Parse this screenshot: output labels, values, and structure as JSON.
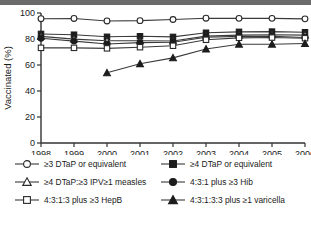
{
  "chart_data": {
    "type": "line",
    "title": "",
    "xlabel": "Year",
    "ylabel": "Vaccinated (%)",
    "x": [
      1998,
      1999,
      2000,
      2001,
      2002,
      2003,
      2004,
      2005,
      2006
    ],
    "xticklabels": [
      "1998",
      "1999",
      "2000",
      "2001",
      "2002",
      "2003",
      "2004",
      "2005",
      "2006"
    ],
    "yticklabels": [
      "0",
      "20",
      "40",
      "60",
      "80",
      "100"
    ],
    "yticks": [
      0,
      20,
      40,
      60,
      80,
      100
    ],
    "xlim": [
      1998,
      2006
    ],
    "ylim": [
      0,
      100
    ],
    "grid": false,
    "legend_position": "below",
    "series": [
      {
        "name": "≥3 DTaP or equivalent",
        "marker": "open-circle",
        "values": [
          95.6,
          95.8,
          93.9,
          94.1,
          95.0,
          96.0,
          95.9,
          95.9,
          95.5
        ]
      },
      {
        "name": "≥4 DTaP or equivalent",
        "marker": "filled-square",
        "values": [
          83.9,
          83.3,
          81.7,
          82.1,
          81.6,
          84.8,
          85.5,
          85.7,
          85.2
        ]
      },
      {
        "name": "≥4 DTaP:≥3 IPV≥1 measles",
        "marker": "open-triangle",
        "values": [
          82.0,
          79.9,
          78.6,
          78.6,
          78.5,
          82.2,
          83.0,
          83.3,
          83.0
        ]
      },
      {
        "name": "4:3:1 plus ≥3 Hib",
        "marker": "filled-circle",
        "values": [
          80.6,
          78.4,
          76.2,
          77.2,
          77.5,
          81.3,
          82.0,
          82.1,
          81.2
        ]
      },
      {
        "name": "4:3:1:3 plus ≥3 HepB",
        "marker": "open-square",
        "values": [
          73.2,
          73.2,
          72.8,
          73.7,
          74.8,
          79.4,
          80.9,
          81.1,
          80.6
        ]
      },
      {
        "name": "4:3:1:3:3 plus ≥1 varicella",
        "marker": "filled-triangle",
        "values": [
          null,
          null,
          54.0,
          61.0,
          65.5,
          72.3,
          76.0,
          76.0,
          76.5
        ]
      }
    ]
  },
  "axes": {
    "ylabel": "Vaccinated (%)",
    "xlabel": "Year"
  },
  "legend": {
    "rows": [
      {
        "left": {
          "label": "≥3 DTaP or equivalent",
          "marker": "open-circle"
        },
        "right": {
          "label": "≥4 DTaP or equivalent",
          "marker": "filled-square"
        }
      },
      {
        "left": {
          "label": "≥4 DTaP:≥3 IPV≥1 measles",
          "marker": "open-triangle"
        },
        "right": {
          "label": "4:3:1 plus ≥3 Hib",
          "marker": "filled-circle"
        }
      },
      {
        "left": {
          "label": "4:3:1:3 plus ≥3 HepB",
          "marker": "open-square"
        },
        "right": {
          "label": "4:3:1:3:3 plus ≥1 varicella",
          "marker": "filled-triangle"
        }
      }
    ]
  },
  "colors": {
    "line": "#3a3a3a",
    "marker_fill": "#1c1c1c",
    "marker_open": "#ffffff",
    "axis": "#333333",
    "topbar": "#6b6b6b"
  }
}
